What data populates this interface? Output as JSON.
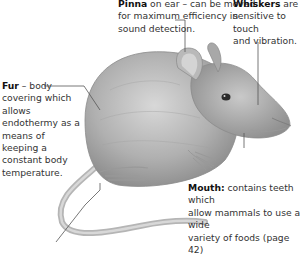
{
  "diagram": {
    "labels": {
      "pinna": {
        "term": "Pinna",
        "text_1": " on ear – can be moved",
        "text_2": "for maximum efficiency in",
        "text_3": "sound detection."
      },
      "whiskers": {
        "term": "Whiskers",
        "text_1": " are",
        "text_2": "sensitive to touch",
        "text_3": "and vibration."
      },
      "fur": {
        "term": "Fur",
        "text_1": " – body",
        "text_2": "covering which",
        "text_3": "allows",
        "text_4": "endothermy as a",
        "text_5": "means of",
        "text_6": "keeping a",
        "text_7": "constant body",
        "text_8": "temperature."
      },
      "mouth": {
        "term": "Mouth:",
        "text_1": " contains teeth which",
        "text_2": "allow mammals to use a wide",
        "text_3": "variety of foods (page 42)"
      }
    },
    "colors": {
      "text": "#333333",
      "leader_line": "#555555",
      "fur_shade": "#9a9a9a",
      "background": "#ffffff"
    }
  }
}
